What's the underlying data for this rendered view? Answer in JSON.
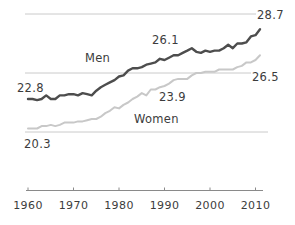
{
  "chart_data": {
    "type": "line",
    "title": "",
    "xlabel": "",
    "ylabel": "",
    "x_start_year": 1960,
    "x_end_year": 2011,
    "x_interval_years": 1,
    "x_ticks": [
      "1960",
      "1970",
      "1980",
      "1990",
      "2000",
      "2010"
    ],
    "ylim": [
      20,
      30
    ],
    "gridline_values": [
      20,
      25,
      30
    ],
    "grid": true,
    "legend_position": "inline-labels",
    "series": [
      {
        "name": "Men",
        "color": "#4d4d4d",
        "labels": {
          "name": "Men",
          "start": "22.8",
          "mid": "26.1",
          "end": "28.7"
        },
        "values": [
          22.8,
          22.8,
          22.7,
          22.8,
          23.1,
          22.8,
          22.8,
          23.1,
          23.1,
          23.2,
          23.2,
          23.1,
          23.3,
          23.2,
          23.1,
          23.5,
          23.8,
          24.0,
          24.2,
          24.4,
          24.7,
          24.8,
          25.2,
          25.4,
          25.4,
          25.5,
          25.7,
          25.8,
          25.9,
          26.2,
          26.1,
          26.3,
          26.5,
          26.5,
          26.7,
          26.9,
          27.1,
          26.8,
          26.7,
          26.9,
          26.8,
          26.9,
          26.9,
          27.1,
          27.4,
          27.1,
          27.5,
          27.5,
          27.6,
          28.1,
          28.2,
          28.7
        ]
      },
      {
        "name": "Women",
        "color": "#c8c8c8",
        "labels": {
          "name": "Women",
          "start": "20.3",
          "mid": "23.9",
          "end": "26.5"
        },
        "values": [
          20.3,
          20.3,
          20.3,
          20.5,
          20.5,
          20.6,
          20.5,
          20.6,
          20.8,
          20.8,
          20.8,
          20.9,
          20.9,
          21.0,
          21.1,
          21.1,
          21.3,
          21.6,
          21.8,
          22.1,
          22.0,
          22.3,
          22.5,
          22.8,
          23.0,
          23.3,
          23.1,
          23.6,
          23.6,
          23.8,
          23.9,
          24.1,
          24.4,
          24.5,
          24.5,
          24.5,
          24.8,
          25.0,
          25.0,
          25.1,
          25.1,
          25.1,
          25.3,
          25.3,
          25.3,
          25.3,
          25.5,
          25.6,
          25.9,
          25.9,
          26.1,
          26.5
        ]
      }
    ],
    "colors": {
      "grid": "#cacaca",
      "axis": "#8a8a8a",
      "text": "#3c3c3c",
      "background": "#ffffff"
    }
  }
}
